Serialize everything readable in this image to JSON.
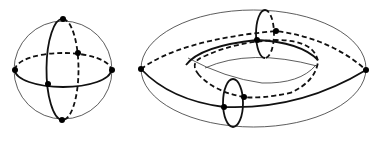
{
  "figure": {
    "panels": [
      {
        "name": "sphere",
        "points": 6
      },
      {
        "name": "torus",
        "points": 6
      }
    ],
    "colors": {
      "line": "#111111",
      "background": "#ffffff"
    }
  }
}
